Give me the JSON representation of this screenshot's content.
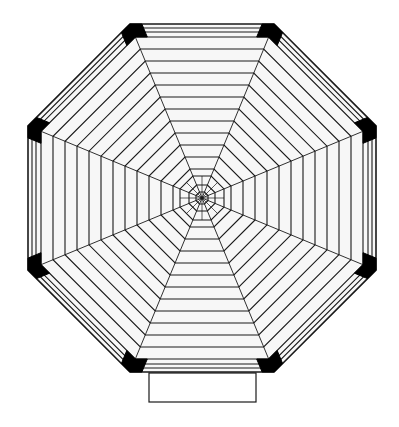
{
  "diagram": {
    "type": "octagonal-floor-plan",
    "canvas": {
      "width": 399,
      "height": 427
    },
    "colors": {
      "background": "#ffffff",
      "fill": "#f7f7f7",
      "line": "#1a1a1a",
      "post": "#000000"
    },
    "center": {
      "x": 202,
      "y": 198
    },
    "outer_apothem": 174,
    "rim_offsets": [
      0,
      4,
      8,
      13
    ],
    "board_spacing": 12,
    "inner_rings_apothem": [
      22,
      13,
      6
    ],
    "rays": 8,
    "corner_posts": 8,
    "entrance": {
      "x": 149,
      "y": 373,
      "width": 107,
      "height": 29
    }
  }
}
